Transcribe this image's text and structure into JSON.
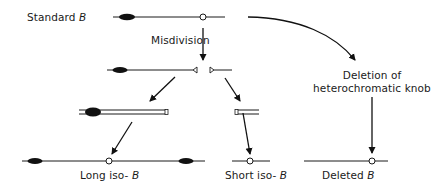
{
  "diagram": {
    "type": "flow",
    "title": "",
    "colors": {
      "line": "#1a1a1a",
      "knob": "#111111",
      "background": "#ffffff"
    },
    "nodes": [
      {
        "id": "standard-b",
        "label_prefix": "Standard",
        "label_italic": "B",
        "shape": "chromosome with knob and centromere"
      },
      {
        "id": "misdivision-products",
        "label": "",
        "shape": "two telocentric fragments"
      },
      {
        "id": "long-telo-doubled",
        "label": "",
        "shape": "doubled long arm"
      },
      {
        "id": "short-telo-doubled",
        "label": "",
        "shape": "doubled short arm"
      },
      {
        "id": "long-iso-b",
        "label_prefix": "Long iso-",
        "label_italic": "B",
        "shape": "isochromosome with two knobs"
      },
      {
        "id": "short-iso-b",
        "label_prefix": "Short iso-",
        "label_italic": "B",
        "shape": "short isochromosome"
      },
      {
        "id": "deleted-b",
        "label_prefix": "Deleted",
        "label_italic": "B",
        "shape": "chromosome without knob"
      }
    ],
    "edges": [
      {
        "from": "standard-b",
        "to": "misdivision-products",
        "label": "Misdivision"
      },
      {
        "from": "standard-b",
        "to": "deleted-b",
        "label": "Deletion of heterochromatic knob"
      },
      {
        "from": "misdivision-products",
        "to": "long-telo-doubled",
        "label": ""
      },
      {
        "from": "misdivision-products",
        "to": "short-telo-doubled",
        "label": ""
      },
      {
        "from": "long-telo-doubled",
        "to": "long-iso-b",
        "label": ""
      },
      {
        "from": "short-telo-doubled",
        "to": "short-iso-b",
        "label": ""
      }
    ]
  },
  "labels": {
    "standard": {
      "prefix": "Standard ",
      "italic": "B"
    },
    "misdivision": "Misdivision",
    "deletion_line1": "Deletion of",
    "deletion_line2": "heterochromatic knob",
    "long_iso": {
      "prefix": "Long iso- ",
      "italic": "B"
    },
    "short_iso": {
      "prefix": "Short iso- ",
      "italic": "B"
    },
    "deleted": {
      "prefix": "Deleted ",
      "italic": "B"
    }
  }
}
